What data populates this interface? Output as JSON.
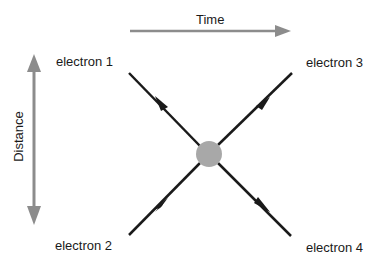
{
  "diagram": {
    "type": "feynman-diagram",
    "axes": {
      "time_label": "Time",
      "distance_label": "Distance",
      "axis_color": "#8c8c8c"
    },
    "particles": [
      {
        "label": "electron 1",
        "position": "top-left"
      },
      {
        "label": "electron 2",
        "position": "bottom-left"
      },
      {
        "label": "electron 3",
        "position": "top-right"
      },
      {
        "label": "electron 4",
        "position": "bottom-right"
      }
    ],
    "vertex": {
      "color": "#a8a8a8"
    },
    "line_color": "#1a1a1a"
  }
}
